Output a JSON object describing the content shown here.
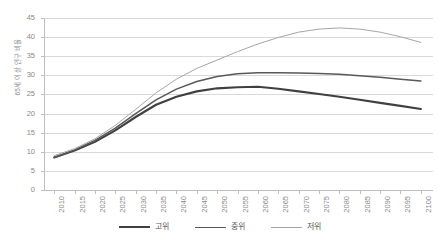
{
  "chart_data": {
    "type": "line",
    "title": "",
    "xlabel": "",
    "ylabel": "65세 이상 인구 비율",
    "ylim": [
      0,
      45
    ],
    "ytick_step": 5,
    "yticks": [
      "0",
      "5",
      "10",
      "15",
      "20",
      "25",
      "30",
      "35",
      "40",
      "45"
    ],
    "grid": true,
    "legend_position": "bottom-center",
    "x": [
      2010,
      2015,
      2020,
      2025,
      2030,
      2035,
      2040,
      2045,
      2050,
      2055,
      2060,
      2065,
      2070,
      2075,
      2080,
      2085,
      2090,
      2095,
      2100
    ],
    "categories": [
      "2010",
      "2015",
      "2020",
      "2025",
      "2030",
      "2035",
      "2040",
      "2045",
      "2050",
      "2055",
      "2060",
      "2065",
      "2070",
      "2075",
      "2080",
      "2085",
      "2090",
      "2095",
      "2100"
    ],
    "series": [
      {
        "name": "고위",
        "color": "#404040",
        "values": [
          8.5,
          10.3,
          12.6,
          15.6,
          19.1,
          22.3,
          24.4,
          25.8,
          26.6,
          26.9,
          27.0,
          26.5,
          25.8,
          25.1,
          24.4,
          23.6,
          22.8,
          22.0,
          21.2
        ]
      },
      {
        "name": "중위",
        "color": "#595959",
        "values": [
          8.5,
          10.5,
          13.0,
          16.2,
          20.0,
          23.6,
          26.4,
          28.4,
          29.7,
          30.4,
          30.7,
          30.7,
          30.6,
          30.5,
          30.3,
          29.9,
          29.5,
          29.0,
          28.5
        ]
      },
      {
        "name": "저위",
        "color": "#a6a6a6",
        "values": [
          9.0,
          10.8,
          13.4,
          16.9,
          21.1,
          25.4,
          29.0,
          31.8,
          34.0,
          36.2,
          38.2,
          39.9,
          41.3,
          42.1,
          42.4,
          42.1,
          41.3,
          40.1,
          38.6
        ]
      }
    ]
  },
  "legend": {
    "items": [
      {
        "label": "고위",
        "color": "#404040",
        "width": 2.2
      },
      {
        "label": "중위",
        "color": "#595959",
        "width": 1.6
      },
      {
        "label": "저위",
        "color": "#a6a6a6",
        "width": 1.1
      }
    ]
  },
  "subcaption": ""
}
